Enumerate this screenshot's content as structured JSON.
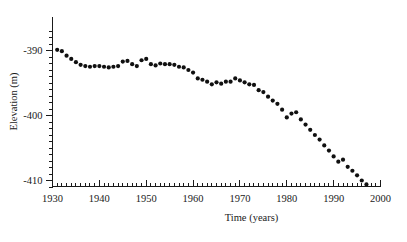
{
  "figure": {
    "background_color": "#ffffff",
    "marker_color": "#101010",
    "axis_color": "#1a1a1a"
  },
  "chart_data": {
    "type": "scatter",
    "title": "",
    "subtitle": "",
    "xlabel": "Time (years)",
    "ylabel": "Elevation (m)",
    "xlim": [
      1930,
      2000
    ],
    "ylim": [
      -413,
      -387.5
    ],
    "grid": false,
    "legend": null,
    "x_major_ticks": [
      1930,
      1940,
      1950,
      1960,
      1970,
      1980,
      1990,
      2000
    ],
    "x_major_tick_labels": [
      "1930",
      "1940",
      "1950",
      "1960",
      "1970",
      "1980",
      "1990",
      "2000"
    ],
    "x_minor_tick_interval": 1,
    "y_major_ticks": [
      -390,
      -400,
      -410
    ],
    "y_major_tick_labels": [
      "-390",
      "-400",
      "-410"
    ],
    "y_minor_tick_interval": 1,
    "marker": "filled-circle",
    "marker_size_px": 3.1,
    "series": [
      {
        "name": "Dead Sea water level",
        "x": [
          1931,
          1932,
          1933,
          1934,
          1935,
          1936,
          1937,
          1938,
          1939,
          1940,
          1941,
          1942,
          1943,
          1944,
          1945,
          1946,
          1947,
          1948,
          1949,
          1950,
          1951,
          1952,
          1953,
          1954,
          1955,
          1956,
          1957,
          1958,
          1959,
          1960,
          1961,
          1962,
          1963,
          1964,
          1965,
          1966,
          1967,
          1968,
          1969,
          1970,
          1971,
          1972,
          1973,
          1974,
          1975,
          1976,
          1977,
          1978,
          1979,
          1980,
          1981,
          1982,
          1983,
          1984,
          1985,
          1986,
          1987,
          1988,
          1989,
          1990,
          1991,
          1992,
          1993,
          1994,
          1995,
          1996,
          1997
        ],
        "y": [
          -389.9,
          -390.1,
          -390.8,
          -391.3,
          -391.8,
          -392.2,
          -392.4,
          -392.5,
          -392.4,
          -392.4,
          -392.5,
          -392.6,
          -392.5,
          -392.4,
          -391.7,
          -391.6,
          -392.1,
          -392.4,
          -391.5,
          -391.3,
          -392.1,
          -392.3,
          -392.0,
          -392.1,
          -392.1,
          -392.2,
          -392.5,
          -392.6,
          -393.0,
          -393.4,
          -394.3,
          -394.5,
          -394.8,
          -395.2,
          -394.9,
          -395.1,
          -394.8,
          -394.8,
          -394.3,
          -394.6,
          -394.9,
          -395.2,
          -395.3,
          -396.1,
          -396.4,
          -397.1,
          -397.7,
          -398.2,
          -399.1,
          -400.3,
          -399.7,
          -399.5,
          -400.6,
          -401.4,
          -402.2,
          -403.0,
          -403.7,
          -404.6,
          -405.4,
          -406.3,
          -407.1,
          -406.8,
          -407.9,
          -408.5,
          -409.2,
          -410.0,
          -410.6
        ]
      }
    ]
  }
}
